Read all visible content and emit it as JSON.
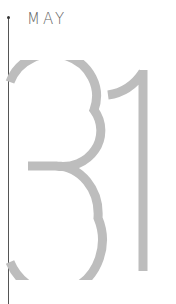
{
  "calendar": {
    "month": "MAY",
    "day": "31",
    "colors": {
      "day_digits": "#bdbdbd",
      "month_text": "#666666",
      "timeline": "#555555"
    }
  }
}
